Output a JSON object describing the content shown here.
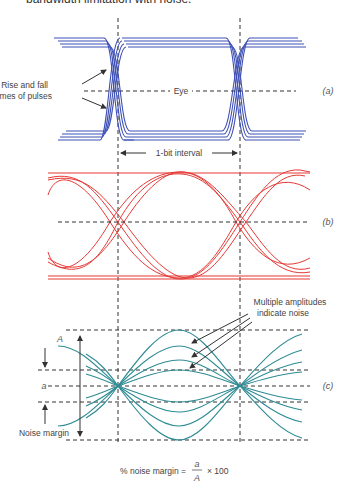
{
  "caption_top": "bandwidth limitation with noise.",
  "panel_a": {
    "tag": "(a)",
    "eye_label": "Eye",
    "annotation_line1": "Rise and fall",
    "annotation_line2": "times of pulses",
    "interval_label": "1-bit interval",
    "trace_color": "#3f51b5"
  },
  "panel_b": {
    "tag": "(b)",
    "trace_color": "#e53935"
  },
  "panel_c": {
    "tag": "(c)",
    "label_A": "A",
    "label_a": "a",
    "noise_margin_label": "Noise margin",
    "annotation_line1": "Multiple amplitudes",
    "annotation_line2": "indicate noise",
    "trace_color": "#2e8b94"
  },
  "formula": {
    "prefix": "% noise margin =",
    "numerator": "a",
    "denominator": "A",
    "suffix": "× 100"
  }
}
